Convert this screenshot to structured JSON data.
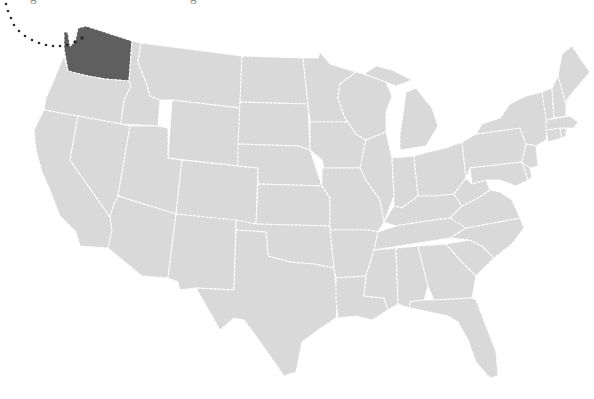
{
  "caption": {
    "left_fragment": "g",
    "right_fragment": "g"
  },
  "map": {
    "title": "United States",
    "land_color": "#d9d9d9",
    "highlight_color": "#5f5f5f",
    "border_color": "#ffffff",
    "highlighted_state": "Washington",
    "callout": {
      "style": "dotted-arc",
      "from": "top-left edge",
      "to": "Puget Sound, Washington",
      "dot_color": "#2a2a2a"
    },
    "states": [
      "Washington",
      "Oregon",
      "California",
      "Idaho",
      "Nevada",
      "Montana",
      "Wyoming",
      "Utah",
      "Arizona",
      "Colorado",
      "New Mexico",
      "North Dakota",
      "South Dakota",
      "Nebraska",
      "Kansas",
      "Oklahoma",
      "Texas",
      "Minnesota",
      "Iowa",
      "Missouri",
      "Arkansas",
      "Louisiana",
      "Wisconsin",
      "Illinois",
      "Michigan",
      "Indiana",
      "Ohio",
      "Kentucky",
      "Tennessee",
      "Mississippi",
      "Alabama",
      "Georgia",
      "Florida",
      "South Carolina",
      "North Carolina",
      "Virginia",
      "West Virginia",
      "Pennsylvania",
      "New York",
      "Maryland",
      "Delaware",
      "New Jersey",
      "Connecticut",
      "Rhode Island",
      "Massachusetts",
      "Vermont",
      "New Hampshire",
      "Maine"
    ]
  }
}
